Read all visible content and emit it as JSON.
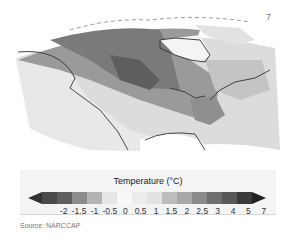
{
  "map": {
    "region": "North America",
    "corner_label": "7"
  },
  "legend": {
    "title": "Temperature (°C)",
    "ticks": [
      "-2",
      "-1.5",
      "-1",
      "-0.5",
      "0",
      "0.5",
      "1",
      "1.5",
      "2",
      "2.5",
      "3",
      "4",
      "5",
      "7"
    ],
    "colors": [
      "#4a4a4a",
      "#5e5e5e",
      "#8c8c8c",
      "#b4b4b4",
      "#e6e6e6",
      "#f5f5f5",
      "#eaeaea",
      "#e0e0e0",
      "#bdbdbd",
      "#a8a8a8",
      "#8a8a8a",
      "#6e6e6e",
      "#585858",
      "#3a3a3a",
      "#262626"
    ]
  },
  "source": "Source: NARCCAP"
}
